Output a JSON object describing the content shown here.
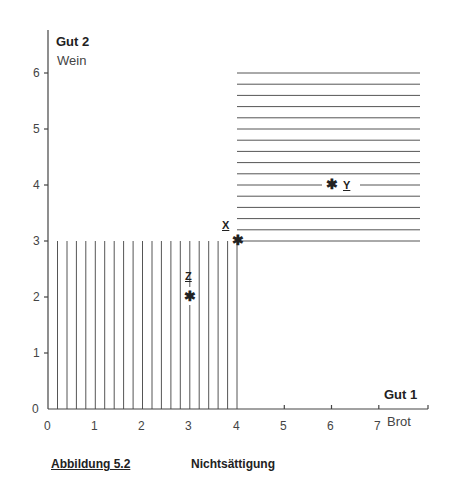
{
  "figure": {
    "y_axis": {
      "title": "Gut 2",
      "subtitle": "Wein",
      "ticks": [
        "0",
        "1",
        "2",
        "3",
        "4",
        "5",
        "6"
      ]
    },
    "x_axis": {
      "title": "Gut 1",
      "subtitle": "Brot",
      "ticks": [
        "0",
        "1",
        "2",
        "3",
        "4",
        "5",
        "6",
        "7"
      ]
    },
    "points": {
      "x": {
        "label": "X",
        "coords": [
          4,
          3
        ]
      },
      "y": {
        "label": "Y",
        "coords": [
          6,
          4
        ]
      },
      "z": {
        "label": "Z",
        "coords": [
          3,
          2
        ]
      }
    },
    "caption": {
      "number": "Abbildung 5.2",
      "title": "Nichtsättigung"
    },
    "regions": {
      "worse": "vertical hatching: x ≤ 4, y ≤ 3",
      "better": "horizontal hatching: x ≥ 4, y ≥ 3"
    }
  }
}
